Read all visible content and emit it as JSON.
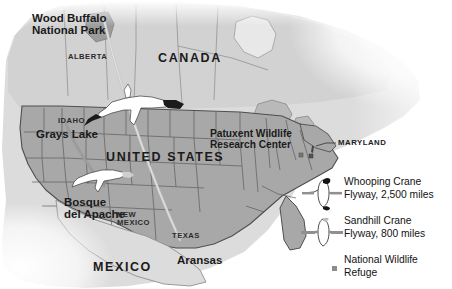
{
  "figure": {
    "type": "thematic-map",
    "background_color": "#ffffff",
    "land_color": "#a8a8a8",
    "water_land_pale_color": "#dcdcdc",
    "border_color": "#555555"
  },
  "map_labels": {
    "wood_buffalo": "Wood Buffalo\nNational Park",
    "wood_buffalo_line1": "Wood Buffalo",
    "wood_buffalo_line2": "National Park",
    "alberta": "ALBERTA",
    "canada": "CANADA",
    "idaho": "IDAHO",
    "grays_lake": "Grays Lake",
    "united_states": "UNITED  STATES",
    "patuxent_line1": "Patuxent Wildlife",
    "patuxent_line2": "Research Center",
    "maryland": "MARYLAND",
    "bosque_line1": "Bosque",
    "bosque_line2": "del Apache",
    "new_mexico_line1": "NEW",
    "new_mexico_line2": "MEXICO",
    "texas": "TEXAS",
    "aransas": "Aransas",
    "mexico": "MEXICO"
  },
  "legend": {
    "items": [
      {
        "id": "whooping-crane",
        "symbol": "whooping-crane-flyway-icon",
        "line1": "Whooping Crane",
        "line2": "Flyway, 2,500 miles",
        "species": "Whooping Crane",
        "distance_miles": 2500
      },
      {
        "id": "sandhill-crane",
        "symbol": "sandhill-crane-flyway-icon",
        "line1": "Sandhill Crane",
        "line2": "Flyway, 800 miles",
        "species": "Sandhill Crane",
        "distance_miles": 800
      },
      {
        "id": "national-wildlife-refuge",
        "symbol": "refuge-square-icon",
        "line1": "National Wildlife",
        "line2": "Refuge",
        "marker_color": "#8d8d8d"
      }
    ]
  },
  "flyways": [
    {
      "name": "Whooping Crane Flyway",
      "from": "Wood Buffalo National Park",
      "to": "Aransas",
      "distance_miles": 2500,
      "color": "#c9c9c9"
    },
    {
      "name": "Sandhill Crane Flyway",
      "from": "Grays Lake",
      "to": "Bosque del Apache",
      "distance_miles": 800,
      "color": "#9b9b9b"
    }
  ],
  "refuge_markers": [
    {
      "name": "Patuxent Wildlife Research Center",
      "region": "MARYLAND"
    }
  ]
}
